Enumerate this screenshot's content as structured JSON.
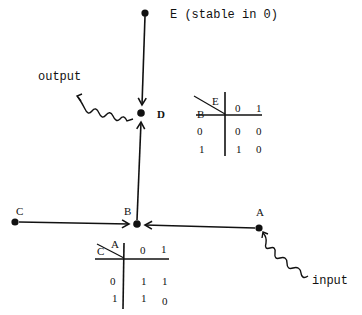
{
  "nodes": {
    "E": {
      "label": "E",
      "note": "(stable in 0)"
    },
    "D": {
      "label": "D"
    },
    "B": {
      "label": "B"
    },
    "C": {
      "label": "C"
    },
    "A": {
      "label": "A"
    }
  },
  "annotations": {
    "output": "output",
    "input": "input"
  },
  "table_D": {
    "row_var": "B",
    "col_var": "E",
    "cols": [
      "0",
      "1"
    ],
    "rows": [
      {
        "key": "0",
        "vals": [
          "0",
          "0"
        ]
      },
      {
        "key": "1",
        "vals": [
          "1",
          "0"
        ]
      }
    ]
  },
  "table_B": {
    "row_var": "C",
    "col_var": "A",
    "cols": [
      "0",
      "1"
    ],
    "rows": [
      {
        "key": "0",
        "vals": [
          "1",
          "1"
        ]
      },
      {
        "key": "1",
        "vals": [
          "1",
          "0"
        ]
      }
    ]
  },
  "colors": {
    "ink": "#111111",
    "background": "#ffffff"
  }
}
